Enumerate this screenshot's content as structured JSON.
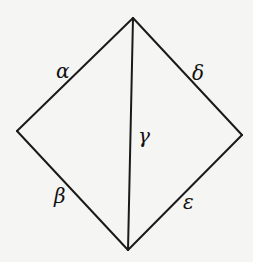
{
  "diagram": {
    "type": "rhombus-with-diagonal",
    "vertices": {
      "top": {
        "x": 133,
        "y": 18
      },
      "left": {
        "x": 17,
        "y": 131
      },
      "right": {
        "x": 242,
        "y": 135
      },
      "bottom": {
        "x": 128,
        "y": 250
      }
    },
    "edges": [
      {
        "id": "alpha",
        "from": "top",
        "to": "left",
        "label": "α",
        "label_pos": {
          "x": 56,
          "y": 78
        }
      },
      {
        "id": "beta",
        "from": "left",
        "to": "bottom",
        "label": "β",
        "label_pos": {
          "x": 54,
          "y": 203
        }
      },
      {
        "id": "gamma",
        "from": "top",
        "to": "bottom",
        "label": "γ",
        "label_pos": {
          "x": 138,
          "y": 143
        }
      },
      {
        "id": "delta",
        "from": "top",
        "to": "right",
        "label": "δ",
        "label_pos": {
          "x": 192,
          "y": 80
        }
      },
      {
        "id": "epsilon",
        "from": "right",
        "to": "bottom",
        "label": "ε",
        "label_pos": {
          "x": 183,
          "y": 209
        }
      }
    ],
    "colors": {
      "stroke": "#1a1a1a",
      "background": "#f5f5f3",
      "text": "#111111"
    }
  }
}
